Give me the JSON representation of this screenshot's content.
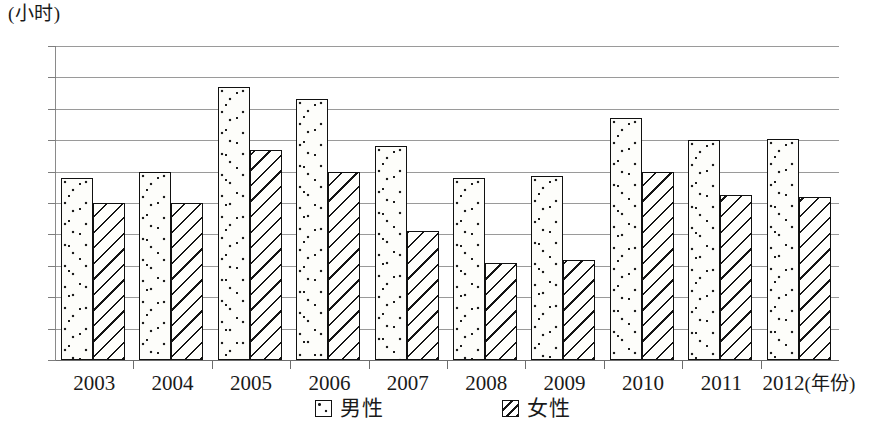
{
  "chart_data": {
    "type": "bar",
    "title": "",
    "subtitle": "",
    "xlabel": "(年份)",
    "ylabel": "(小时)",
    "categories": [
      "2003",
      "2004",
      "2005",
      "2006",
      "2007",
      "2008",
      "2009",
      "2010",
      "2011",
      "2012"
    ],
    "series": [
      {
        "name": "男性",
        "pattern": "dotted",
        "values": [
          45.8,
          46.0,
          48.7,
          48.3,
          46.8,
          45.8,
          45.85,
          47.7,
          47.0,
          47.05
        ]
      },
      {
        "name": "女性",
        "pattern": "diagonal-hatch",
        "values": [
          45.0,
          45.0,
          46.7,
          46.0,
          44.1,
          43.1,
          43.2,
          46.0,
          45.25,
          45.2
        ]
      }
    ],
    "ylim": [
      40,
      50
    ],
    "ytick_labels": [
      "50",
      "49",
      "48",
      "47",
      "46",
      "45",
      "44",
      "43",
      "42",
      "41",
      "40"
    ],
    "ytick_values": [
      50,
      49,
      48,
      47,
      46,
      45,
      44,
      43,
      42,
      41,
      40
    ],
    "grid": true,
    "legend_position": "bottom"
  },
  "legend": {
    "items": [
      {
        "label": "男性",
        "swatch": "dotted-square-icon"
      },
      {
        "label": "女性",
        "swatch": "hatched-square-icon"
      }
    ]
  },
  "axis": {
    "unit_caption": "(小时)",
    "x_unit_caption": "(年份)"
  }
}
